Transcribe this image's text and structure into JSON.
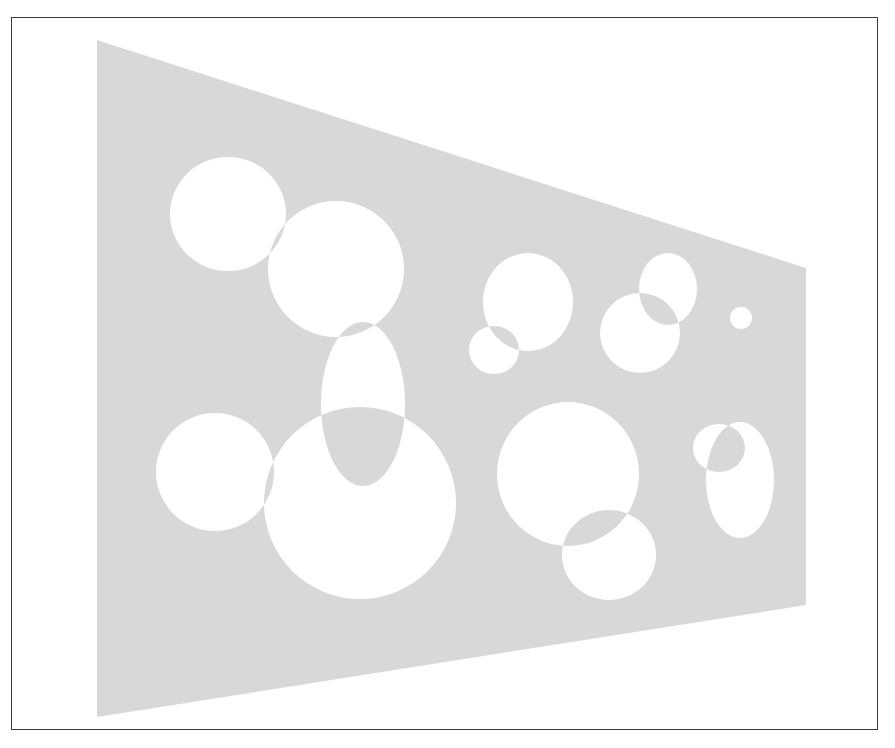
{
  "figure": {
    "colors": {
      "background": "#ffffff",
      "trapezoid_fill": "#d8d8d8",
      "shape_fill": "#ffffff",
      "frame_border": "#3a3a3a"
    },
    "trapezoid": {
      "points": [
        [
          97,
          40
        ],
        [
          806,
          268
        ],
        [
          806,
          605
        ],
        [
          97,
          717
        ]
      ]
    },
    "shapes": [
      {
        "id": "c1",
        "cx": 228,
        "cy": 214,
        "rx": 58,
        "ry": 57
      },
      {
        "id": "c2",
        "cx": 336,
        "cy": 269,
        "rx": 68,
        "ry": 68
      },
      {
        "id": "e3",
        "cx": 363,
        "cy": 404,
        "rx": 42,
        "ry": 82
      },
      {
        "id": "c4",
        "cx": 215,
        "cy": 472,
        "rx": 59,
        "ry": 59
      },
      {
        "id": "c5",
        "cx": 360,
        "cy": 503,
        "rx": 96,
        "ry": 96
      },
      {
        "id": "c6",
        "cx": 528,
        "cy": 302,
        "rx": 45,
        "ry": 49
      },
      {
        "id": "c7",
        "cx": 494,
        "cy": 350,
        "rx": 25,
        "ry": 24
      },
      {
        "id": "c8",
        "cx": 668,
        "cy": 289,
        "rx": 29,
        "ry": 36
      },
      {
        "id": "c9",
        "cx": 640,
        "cy": 333,
        "rx": 40,
        "ry": 40
      },
      {
        "id": "c10",
        "cx": 741,
        "cy": 318,
        "rx": 11,
        "ry": 11
      },
      {
        "id": "c11",
        "cx": 568,
        "cy": 474,
        "rx": 71,
        "ry": 72
      },
      {
        "id": "c12",
        "cx": 609,
        "cy": 555,
        "rx": 47,
        "ry": 45
      },
      {
        "id": "c13",
        "cx": 719,
        "cy": 448,
        "rx": 26,
        "ry": 24
      },
      {
        "id": "c14",
        "cx": 740,
        "cy": 480,
        "rx": 34,
        "ry": 58
      }
    ]
  }
}
